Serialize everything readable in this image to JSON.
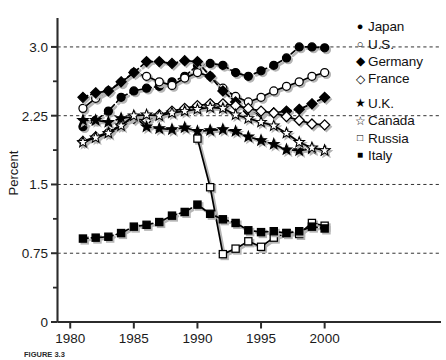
{
  "chart_data": {
    "type": "line",
    "title": "",
    "xlabel": "",
    "ylabel": "Percent",
    "xlim": [
      1979.0,
      2001.6
    ],
    "ylim": [
      0,
      3.25
    ],
    "xticks": [
      1980,
      1985,
      1990,
      1995,
      2000
    ],
    "xtick_labels": [
      "1980",
      "1985",
      "1990",
      "1995",
      "2000"
    ],
    "yticks": [
      0,
      0.75,
      1.5,
      2.25,
      3.0
    ],
    "ytick_labels": [
      "0",
      "0.75",
      "1.5",
      "2.25",
      "3.0"
    ],
    "y_minor_ticks": [
      0.375,
      1.125,
      1.875,
      2.625
    ],
    "grid": "horizontal-dashed-at-major-y",
    "legend_position": "right",
    "x": [
      1981,
      1982,
      1983,
      1984,
      1985,
      1986,
      1987,
      1988,
      1989,
      1990,
      1991,
      1992,
      1993,
      1994,
      1995,
      1996,
      1997,
      1998,
      1999,
      2000
    ],
    "series": [
      {
        "name": "Japan",
        "marker": "filled-circle",
        "line": "dashed",
        "values": [
          2.13,
          2.2,
          2.3,
          2.45,
          2.52,
          2.55,
          2.57,
          2.62,
          2.68,
          2.8,
          2.82,
          2.8,
          2.72,
          2.68,
          2.74,
          2.8,
          2.88,
          3.0,
          3.0,
          2.99
        ]
      },
      {
        "name": "U.S.",
        "marker": "open-circle",
        "line": "solid",
        "values": [
          2.33,
          2.44,
          2.52,
          2.61,
          2.72,
          2.68,
          2.62,
          2.58,
          2.66,
          2.72,
          2.68,
          2.55,
          2.46,
          2.4,
          2.45,
          2.52,
          2.57,
          2.62,
          2.68,
          2.72
        ]
      },
      {
        "name": "Germany",
        "marker": "filled-diamond",
        "line": "dashed",
        "values": [
          2.45,
          2.5,
          2.52,
          2.62,
          2.72,
          2.84,
          2.84,
          2.82,
          2.85,
          2.84,
          2.68,
          2.52,
          2.4,
          2.3,
          2.28,
          2.28,
          2.3,
          2.32,
          2.38,
          2.45
        ]
      },
      {
        "name": "France",
        "marker": "open-diamond",
        "line": "solid",
        "values": [
          1.97,
          2.02,
          2.07,
          2.15,
          2.22,
          2.2,
          2.26,
          2.3,
          2.33,
          2.36,
          2.38,
          2.38,
          2.36,
          2.33,
          2.3,
          2.28,
          2.24,
          2.2,
          2.16,
          2.15
        ]
      },
      {
        "name": "U.K.",
        "marker": "filled-star",
        "line": "dashed",
        "values": [
          2.2,
          2.2,
          2.18,
          2.22,
          2.24,
          2.13,
          2.11,
          2.1,
          2.12,
          2.08,
          2.09,
          2.1,
          2.08,
          2.02,
          1.98,
          1.94,
          1.88,
          1.87,
          1.89,
          1.87
        ]
      },
      {
        "name": "Canada",
        "marker": "open-star",
        "line": "solid",
        "values": [
          1.96,
          2.01,
          2.06,
          2.14,
          2.25,
          2.26,
          2.25,
          2.28,
          2.3,
          2.32,
          2.34,
          2.33,
          2.26,
          2.22,
          2.18,
          2.14,
          2.06,
          1.96,
          1.9,
          1.87
        ]
      },
      {
        "name": "Russia",
        "marker": "open-square",
        "line": "solid",
        "values": [
          null,
          null,
          null,
          null,
          null,
          null,
          null,
          null,
          null,
          2.0,
          1.47,
          0.74,
          0.8,
          0.88,
          0.82,
          0.92,
          0.97,
          0.96,
          1.08,
          1.05
        ]
      },
      {
        "name": "Italy",
        "marker": "filled-square",
        "line": "dashed",
        "values": [
          0.91,
          0.92,
          0.93,
          0.97,
          1.04,
          1.06,
          1.09,
          1.16,
          1.2,
          1.28,
          1.18,
          1.12,
          1.08,
          1.0,
          0.98,
          0.99,
          0.97,
          0.99,
          1.04,
          1.02
        ]
      }
    ]
  },
  "legend": {
    "groups": [
      {
        "items": [
          {
            "label": "Japan",
            "marker": "filled-circle",
            "glyph": "●"
          },
          {
            "label": "U.S.",
            "marker": "open-circle",
            "glyph": "○"
          },
          {
            "label": "Germany",
            "marker": "filled-diamond",
            "glyph": "◆"
          },
          {
            "label": "France",
            "marker": "open-diamond",
            "glyph": "◇"
          }
        ]
      },
      {
        "items": [
          {
            "label": "U.K.",
            "marker": "filled-star",
            "glyph": "★"
          },
          {
            "label": "Canada",
            "marker": "open-star",
            "glyph": "☆"
          },
          {
            "label": "Russia",
            "marker": "open-square",
            "glyph": "□"
          },
          {
            "label": "Italy",
            "marker": "filled-square",
            "glyph": "■"
          }
        ]
      }
    ]
  },
  "caption": {
    "text": "FIGURE 3.3"
  },
  "colors": {
    "ink": "#111111",
    "axis": "#2b2b2b",
    "grid": "#333333",
    "background": "#ffffff",
    "shadow": "#b5b5b5"
  }
}
